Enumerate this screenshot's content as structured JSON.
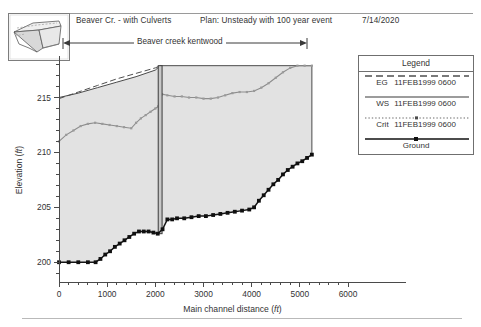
{
  "header": {
    "title": "Beaver Cr. - with Culverts",
    "plan": "Plan: Unsteady with 100 year event",
    "date": "7/14/2020"
  },
  "reach": {
    "label": "Beaver creek kentwood"
  },
  "inset": {
    "name": "river-schematic-thumbnail"
  },
  "legend": {
    "title": "Legend",
    "rows": [
      {
        "key": "EG",
        "label": "11FEB1999 0600",
        "style": "dashed",
        "color": "#4f4f4f"
      },
      {
        "key": "WS",
        "label": "11FEB1999 0600",
        "style": "solid",
        "color": "#3a3a3a"
      },
      {
        "key": "Crit",
        "label": "11FEB1999 0600",
        "style": "dotted",
        "color": "#6a6a6a"
      },
      {
        "key": "Ground",
        "label": "",
        "style": "solid-marker",
        "color": "#101010"
      }
    ]
  },
  "chart_data": {
    "type": "line",
    "title": "Beaver Cr. - with Culverts",
    "subtitle": "Plan: Unsteady with 100 year event",
    "xlabel": "Main channel distance (ft)",
    "ylabel": "Elevation (ft)",
    "xlim": [
      0,
      6000
    ],
    "ylim": [
      198.2,
      218.6
    ],
    "xticks": [
      0,
      1000,
      2000,
      3000,
      4000,
      5000,
      6000
    ],
    "yticks": [
      200,
      205,
      210,
      215
    ],
    "xticklabels": [
      "0",
      "1000",
      "2000",
      "3000",
      "4000",
      "5000",
      "6000"
    ],
    "yticklabels": [
      "200",
      "205",
      "210",
      "215"
    ],
    "minor_ticks": true,
    "grid": false,
    "legend_position": "right",
    "structure": {
      "name": "culvert",
      "x_left": 2060,
      "x_right": 2140,
      "y_bottom": 202.6,
      "y_top": 217.9
    },
    "series": [
      {
        "name": "Ground",
        "style": "solid-marker",
        "x": [
          0,
          200,
          400,
          600,
          760,
          860,
          960,
          1060,
          1160,
          1260,
          1360,
          1460,
          1560,
          1660,
          1760,
          1860,
          1960,
          2050,
          2150,
          2250,
          2350,
          2450,
          2600,
          2750,
          2900,
          3050,
          3200,
          3350,
          3500,
          3650,
          3800,
          3950,
          4050,
          4150,
          4250,
          4350,
          4450,
          4550,
          4650,
          4750,
          4850,
          4950,
          5050,
          5150,
          5250
        ],
        "y": [
          200.0,
          200.0,
          200.0,
          200.0,
          200.0,
          200.3,
          200.7,
          201.0,
          201.4,
          201.7,
          202.0,
          202.3,
          202.6,
          202.8,
          202.8,
          202.8,
          202.7,
          202.6,
          203.0,
          203.9,
          203.9,
          204.0,
          204.0,
          204.1,
          204.2,
          204.2,
          204.3,
          204.4,
          204.5,
          204.6,
          204.7,
          204.8,
          205.0,
          205.6,
          206.1,
          206.6,
          207.1,
          207.5,
          208.0,
          208.4,
          208.7,
          209.0,
          209.2,
          209.5,
          209.8
        ]
      },
      {
        "name": "WS 11FEB1999 0600",
        "style": "solid-marker-small",
        "x": [
          0,
          150,
          300,
          450,
          600,
          750,
          900,
          1050,
          1200,
          1350,
          1500,
          1600,
          1700,
          1800,
          1900,
          2000,
          2060,
          2140,
          2250,
          2400,
          2550,
          2700,
          2850,
          3000,
          3150,
          3300,
          3450,
          3600,
          3750,
          3900,
          4050,
          4200,
          4350,
          4500,
          4650,
          4800,
          4950,
          5100,
          5250
        ],
        "y": [
          211.0,
          211.6,
          212.0,
          212.4,
          212.6,
          212.7,
          212.6,
          212.5,
          212.4,
          212.3,
          212.2,
          212.7,
          213.1,
          213.4,
          213.7,
          214.0,
          214.2,
          215.3,
          215.2,
          215.1,
          215.1,
          215.0,
          215.0,
          214.9,
          214.9,
          215.0,
          215.2,
          215.4,
          215.5,
          215.5,
          215.6,
          215.9,
          216.3,
          216.8,
          217.3,
          217.7,
          217.9,
          217.9,
          217.9
        ]
      },
      {
        "name": "EG 11FEB1999 0600",
        "style": "dashed",
        "x": [
          0,
          400,
          800,
          1200,
          1600,
          2000,
          2100
        ],
        "y": [
          214.9,
          215.5,
          216.1,
          216.7,
          217.2,
          217.7,
          217.9
        ]
      },
      {
        "name": "Bank / top boundary",
        "style": "solid",
        "x": [
          0,
          400,
          800,
          1200,
          1600,
          2000,
          2100,
          5250
        ],
        "y": [
          215.0,
          215.4,
          215.9,
          216.4,
          216.9,
          217.5,
          217.9,
          217.9
        ]
      }
    ]
  }
}
